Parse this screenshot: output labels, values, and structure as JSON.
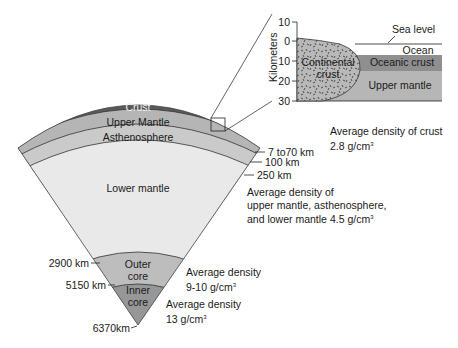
{
  "diagram": {
    "layers": [
      {
        "name": "Crust",
        "color": "#5a5a5a"
      },
      {
        "name": "Upper Mantle",
        "color": "#b5b5b5"
      },
      {
        "name": "Asthenosphere",
        "color": "#cacaca"
      },
      {
        "name": "Lower mantle",
        "color": "#e9e9e9"
      },
      {
        "name_line1": "Outer",
        "name_line2": "core",
        "color": "#bdbdbd"
      },
      {
        "name_line1": "Inner",
        "name_line2": "core",
        "color": "#979797"
      }
    ],
    "depth_labels": {
      "crust": "7 to70 km",
      "upper_mantle": "100 km",
      "asthenosphere": "250 km",
      "outer_core": "2900 km",
      "inner_core": "5150 km",
      "center": "6370km"
    },
    "densities": {
      "crust_line1": "Average density of crust",
      "crust_line2": "2.8 g/cm",
      "mantle_line1": "Average density of",
      "mantle_line2": "upper mantle, asthenosphere,",
      "mantle_line3": "and lower mantle 4.5 g/cm",
      "outer_core_line1": "Average density",
      "outer_core_line2": "9-10 g/cm",
      "inner_core_line1": "Average density",
      "inner_core_line2": "13 g/cm",
      "superscript": "3"
    },
    "inset": {
      "axis_label": "Kilometers",
      "ticks": [
        "10",
        "0",
        "10",
        "20",
        "30"
      ],
      "sea_level": "Sea level",
      "ocean": "Ocean",
      "continental_line1": "Continental",
      "continental_line2": "crust",
      "oceanic_crust": "Oceanic crust",
      "upper_mantle": "Upper mantle"
    }
  }
}
